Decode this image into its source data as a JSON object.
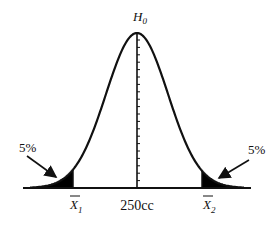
{
  "diagram": {
    "type": "normal-distribution",
    "hypothesis_label": "H",
    "hypothesis_subscript": "0",
    "center_label": "250cc",
    "left_critical": {
      "symbol": "X",
      "subscript": "1",
      "overbar": true
    },
    "right_critical": {
      "symbol": "X",
      "subscript": "2",
      "overbar": true
    },
    "left_tail_label": "5%",
    "right_tail_label": "5%",
    "colors": {
      "stroke": "#111111",
      "fill": "#000000",
      "background": "#ffffff"
    },
    "geometry": {
      "center_x": 137,
      "baseline_y": 188,
      "peak_y": 33,
      "sigma_px": 31,
      "axis_x_start": 23,
      "axis_x_end": 251,
      "left_cut_x": 73,
      "right_cut_x": 202,
      "tick_count": 20
    }
  }
}
